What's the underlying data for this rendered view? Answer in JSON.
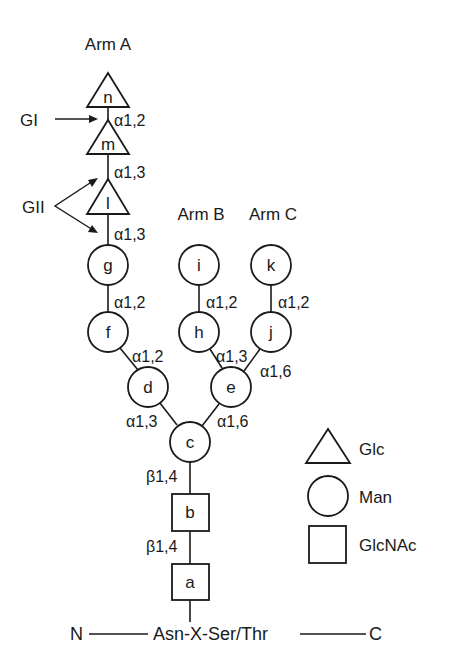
{
  "diagram": {
    "arms": {
      "a": "Arm A",
      "b": "Arm B",
      "c": "Arm C"
    },
    "enzymes": {
      "gi": "GI",
      "gii": "GII"
    },
    "nodes": {
      "n": {
        "label": "n",
        "type": "Glc"
      },
      "m": {
        "label": "m",
        "type": "Glc"
      },
      "l": {
        "label": "l",
        "type": "Glc"
      },
      "g": {
        "label": "g",
        "type": "Man"
      },
      "f": {
        "label": "f",
        "type": "Man"
      },
      "d": {
        "label": "d",
        "type": "Man"
      },
      "i": {
        "label": "i",
        "type": "Man"
      },
      "h": {
        "label": "h",
        "type": "Man"
      },
      "k": {
        "label": "k",
        "type": "Man"
      },
      "j": {
        "label": "j",
        "type": "Man"
      },
      "e": {
        "label": "e",
        "type": "Man"
      },
      "c": {
        "label": "c",
        "type": "Man"
      },
      "b": {
        "label": "b",
        "type": "GlcNAc"
      },
      "a": {
        "label": "a",
        "type": "GlcNAc"
      }
    },
    "bonds": {
      "n_m": "α1,2",
      "m_l": "α1,3",
      "l_g": "α1,3",
      "g_f": "α1,2",
      "f_d": "α1,2",
      "i_h": "α1,2",
      "k_j": "α1,2",
      "h_e": "α1,3",
      "j_e": "α1,6",
      "d_c": "α1,3",
      "e_c": "α1,6",
      "c_b": "β1,4",
      "b_a": "β1,4"
    },
    "peptide": {
      "n_term": "N",
      "sequon": "Asn-X-Ser/Thr",
      "c_term": "C"
    },
    "legend": [
      {
        "shape": "triangle",
        "label": "Glc"
      },
      {
        "shape": "circle",
        "label": "Man"
      },
      {
        "shape": "square",
        "label": "GlcNAc"
      }
    ]
  }
}
